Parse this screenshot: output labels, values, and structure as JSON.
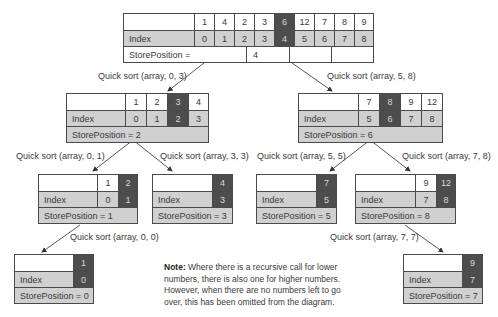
{
  "diagram": {
    "type": "quicksort-recursion-tree",
    "colors": {
      "pivot_fill": "#4d4d4d",
      "index_row_fill": "#d0d0d0",
      "border": "#4a4a4a"
    },
    "root": {
      "values": [
        "1",
        "4",
        "2",
        "3",
        "6",
        "12",
        "7",
        "8",
        "9"
      ],
      "index_label": "Index",
      "indices": [
        "0",
        "1",
        "2",
        "3",
        "4",
        "5",
        "6",
        "7",
        "8"
      ],
      "pivot_position": 4,
      "store_label": "StorePosition =",
      "store_value": "4"
    },
    "calls": {
      "c_0_3": "Quick sort (array, 0, 3)",
      "c_5_8": "Quick sort (array, 5, 8)",
      "c_0_1": "Quick sort (array, 0, 1)",
      "c_3_3": "Quick sort (array, 3, 3)",
      "c_5_5": "Quick sort (array, 5, 5)",
      "c_7_8": "Quick sort (array, 7, 8)",
      "c_0_0": "Quick sort (array, 0, 0)",
      "c_7_7": "Quick sort (array, 7, 7)"
    },
    "nodes": {
      "n_0_3": {
        "values": [
          "1",
          "2",
          "3",
          "4"
        ],
        "indices": [
          "0",
          "1",
          "2",
          "3"
        ],
        "pivot_position": 2,
        "index_label": "Index",
        "store": "StorePosition = 2"
      },
      "n_5_8": {
        "values": [
          "7",
          "8",
          "9",
          "12"
        ],
        "indices": [
          "5",
          "6",
          "7",
          "8"
        ],
        "pivot_position": 1,
        "index_label": "Index",
        "store": "StorePosition = 6"
      },
      "n_0_1": {
        "values": [
          "1",
          "2"
        ],
        "indices": [
          "0",
          "1"
        ],
        "pivot_position": 1,
        "index_label": "Index",
        "store": "StorePosition = 1"
      },
      "n_3_3": {
        "values": [
          "4"
        ],
        "indices": [
          "3"
        ],
        "pivot_position": 0,
        "index_label": "Index",
        "store": "StorePosition = 3"
      },
      "n_5_5": {
        "values": [
          "7"
        ],
        "indices": [
          "5"
        ],
        "pivot_position": 0,
        "index_label": "Index",
        "store": "StorePosition = 5"
      },
      "n_7_8": {
        "values": [
          "9",
          "12"
        ],
        "indices": [
          "7",
          "8"
        ],
        "pivot_position": 1,
        "index_label": "Index",
        "store": "StorePosition = 8"
      },
      "n_0_0": {
        "values": [
          "1"
        ],
        "indices": [
          "0"
        ],
        "pivot_position": 0,
        "index_label": "Index",
        "store": "StorePosition = 0"
      },
      "n_7_7": {
        "values": [
          "9"
        ],
        "indices": [
          "7"
        ],
        "pivot_position": 0,
        "index_label": "Index",
        "store": "StorePosition = 7"
      }
    },
    "note": {
      "bold": "Note:",
      "text": " Where there is a recursive call for lower numbers, there is also one for higher numbers. However, when there are no numbers left to go over, this has been omitted from the diagram."
    }
  }
}
